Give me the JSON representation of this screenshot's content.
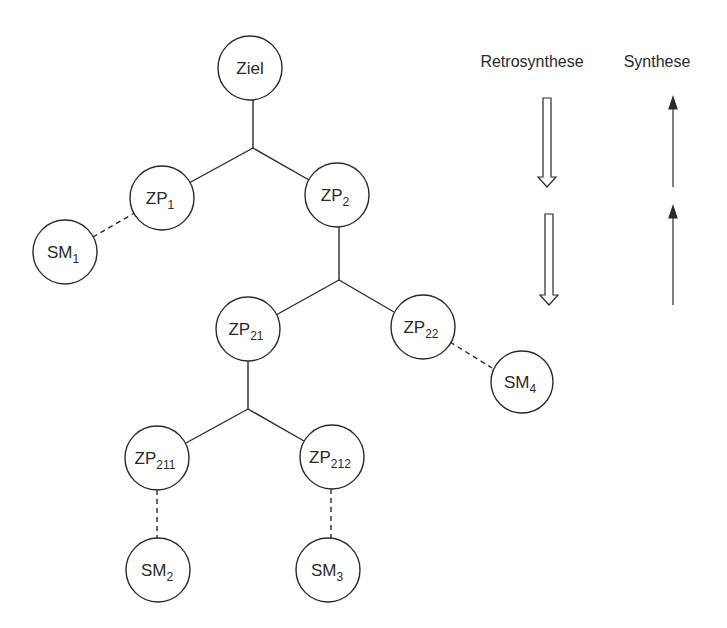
{
  "headers": {
    "retro": "Retrosynthese",
    "synth": "Synthese"
  },
  "nodes": {
    "ziel": {
      "main": "Ziel",
      "sub": ""
    },
    "zp1": {
      "main": "ZP",
      "sub": "1"
    },
    "zp2": {
      "main": "ZP",
      "sub": "2"
    },
    "sm1": {
      "main": "SM",
      "sub": "1"
    },
    "zp21": {
      "main": "ZP",
      "sub": "21"
    },
    "zp22": {
      "main": "ZP",
      "sub": "22"
    },
    "sm4": {
      "main": "SM",
      "sub": "4"
    },
    "zp211": {
      "main": "ZP",
      "sub": "211"
    },
    "zp212": {
      "main": "ZP",
      "sub": "212"
    },
    "sm2": {
      "main": "SM",
      "sub": "2"
    },
    "sm3": {
      "main": "SM",
      "sub": "3"
    }
  },
  "edges": [
    {
      "from": "Ziel",
      "to": "ZP1 + ZP2",
      "style": "solid"
    },
    {
      "from": "ZP1",
      "to": "SM1",
      "style": "dashed"
    },
    {
      "from": "ZP2",
      "to": "ZP21 + ZP22",
      "style": "solid"
    },
    {
      "from": "ZP22",
      "to": "SM4",
      "style": "dashed"
    },
    {
      "from": "ZP21",
      "to": "ZP211 + ZP212",
      "style": "solid"
    },
    {
      "from": "ZP211",
      "to": "SM2",
      "style": "dashed"
    },
    {
      "from": "ZP212",
      "to": "SM3",
      "style": "dashed"
    }
  ],
  "arrows": {
    "retro": {
      "direction": "down",
      "style": "hollow",
      "count": 2
    },
    "synth": {
      "direction": "up",
      "style": "solid",
      "count": 2
    }
  },
  "colors": {
    "stroke": "#2a2a2a",
    "background": "#ffffff"
  }
}
